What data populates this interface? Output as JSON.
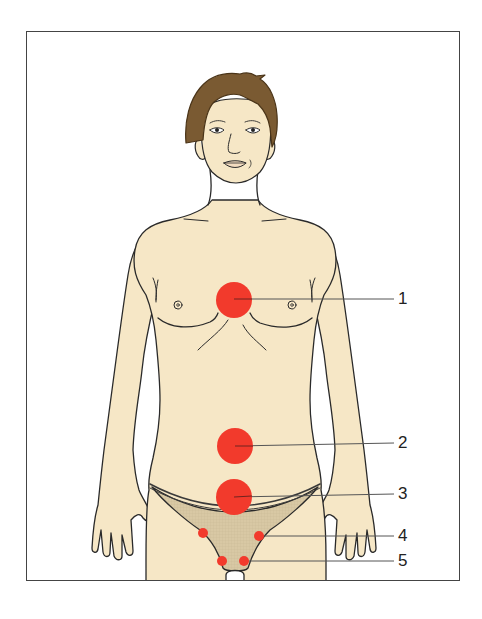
{
  "figure": {
    "colors": {
      "skin": "#f6e7c6",
      "outline": "#2a2a2a",
      "hair": "#7a5a32",
      "hair_dark": "#4a3418",
      "marker": "#f23a2c",
      "underwear": "#d8c8a4",
      "underwear_band": "#3a3a3a",
      "leader_line": "#555555",
      "frame": "#444444"
    },
    "markers": [
      {
        "id": "1",
        "label": "1",
        "cx": 234,
        "cy": 300,
        "r": 18,
        "label_x": 398,
        "label_y": 290
      },
      {
        "id": "2",
        "label": "2",
        "cx": 235,
        "cy": 446,
        "r": 18,
        "label_x": 398,
        "label_y": 434
      },
      {
        "id": "3",
        "label": "3",
        "cx": 234,
        "cy": 497,
        "r": 18,
        "label_x": 398,
        "label_y": 485
      },
      {
        "id": "4",
        "label": "4",
        "cx": 259,
        "cy": 536,
        "r": 5,
        "label_x": 398,
        "label_y": 526
      },
      {
        "id": "5",
        "label": "5",
        "cx": 244,
        "cy": 561,
        "r": 5,
        "label_x": 398,
        "label_y": 552
      }
    ],
    "extra_markers": [
      {
        "cx": 203,
        "cy": 533,
        "r": 5
      },
      {
        "cx": 222,
        "cy": 561,
        "r": 5
      }
    ]
  }
}
